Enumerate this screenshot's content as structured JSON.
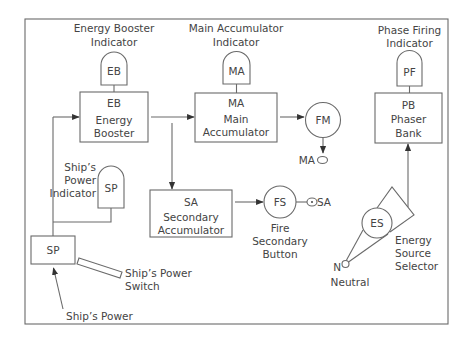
{
  "diagram": {
    "indicators": {
      "energy_booster": {
        "label": [
          "Energy Booster",
          "Indicator"
        ],
        "code": "EB"
      },
      "main_accumulator": {
        "label": [
          "Main Accumulator",
          "Indicator"
        ],
        "code": "MA"
      },
      "phase_firing": {
        "label": [
          "Phase Firing",
          "Indicator"
        ],
        "code": "PF"
      },
      "ships_power": {
        "label": [
          "Ship’s",
          "Power",
          "Indicator"
        ],
        "code": "SP"
      }
    },
    "components": {
      "energy_booster": {
        "code": "EB",
        "name": [
          "Energy",
          "Booster"
        ]
      },
      "main_accumulator": {
        "code": "MA",
        "name": [
          "Main",
          "Accumulator"
        ]
      },
      "phaser_bank": {
        "code": "PB",
        "name": [
          "Phaser",
          "Bank"
        ]
      },
      "secondary_accumulator": {
        "code": "SA",
        "name": [
          "Secondary",
          "Accumulator"
        ]
      },
      "ships_power": {
        "code": "SP"
      }
    },
    "buttons": {
      "fire_main": {
        "code": "FM",
        "output": "MA"
      },
      "fire_secondary": {
        "code": "FS",
        "label": [
          "Fire",
          "Secondary",
          "Button"
        ],
        "output": "SA"
      }
    },
    "switch": {
      "label": [
        "Ship’s Power",
        "Switch"
      ]
    },
    "selector": {
      "code": "ES",
      "label": [
        "Energy",
        "Source",
        "Selector"
      ],
      "neutral_code": "N",
      "neutral_label": "Neutral"
    },
    "power_input": {
      "label": "Ship’s Power"
    }
  },
  "colors": {
    "background": "#ffffff",
    "line": "#6a6a6a",
    "text": "#444444"
  }
}
